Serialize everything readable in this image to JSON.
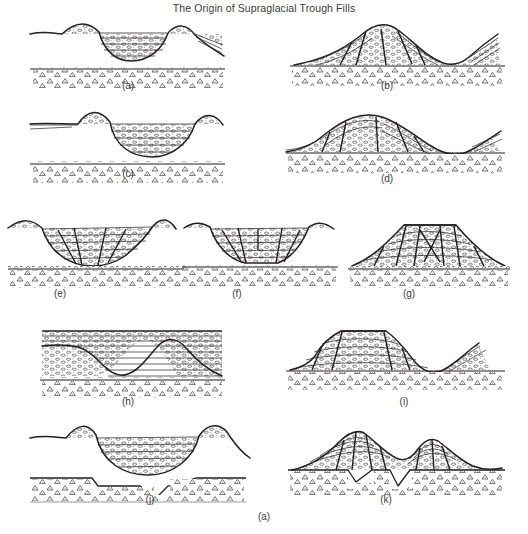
{
  "figure": {
    "title": "The Origin of Supraglacial Trough Fills",
    "caption": "(a)",
    "background_color": "#ffffff",
    "ink_color": "#231f20",
    "width": 528,
    "height": 534
  },
  "legend_semantics": {
    "fill_texture": "stratified-pebbly-sediment",
    "substrate_texture": "diamicton-triangles",
    "line_texture": "fault-and-bedding-lines"
  },
  "panels": [
    {
      "id": "a",
      "label": "(a)",
      "row": 1,
      "col": 1,
      "type": "trough-fill-basin",
      "label_x": 128,
      "label_y": 80
    },
    {
      "id": "b",
      "label": "(b)",
      "row": 1,
      "col": 2,
      "type": "inverted-mound-faulted",
      "label_x": 387,
      "label_y": 80
    },
    {
      "id": "c",
      "label": "(c)",
      "row": 2,
      "col": 1,
      "type": "deep-trough-fill",
      "label_x": 128,
      "label_y": 168
    },
    {
      "id": "d",
      "label": "(d)",
      "row": 2,
      "col": 2,
      "type": "inverted-broad-mound",
      "label_x": 387,
      "label_y": 173
    },
    {
      "id": "e",
      "label": "(e)",
      "row": 3,
      "col": 1,
      "type": "wide-shallow-basin",
      "label_x": 60,
      "label_y": 288
    },
    {
      "id": "f",
      "label": "(f)",
      "row": 3,
      "col": 2,
      "type": "flat-floored-basin",
      "label_x": 237,
      "label_y": 288
    },
    {
      "id": "g",
      "label": "(g)",
      "row": 3,
      "col": 3,
      "type": "inverted-plateau-mound",
      "label_x": 409,
      "label_y": 288
    },
    {
      "id": "h",
      "label": "(h)",
      "row": 4,
      "col": 1,
      "type": "buried-trough-flat-fill",
      "label_x": 128,
      "label_y": 396
    },
    {
      "id": "i",
      "label": "(i)",
      "row": 4,
      "col": 2,
      "type": "inverted-flat-topped-mound",
      "label_x": 404,
      "label_y": 396
    },
    {
      "id": "j",
      "label": "(j)",
      "row": 5,
      "col": 1,
      "type": "trough-over-irregular-substrate",
      "label_x": 150,
      "label_y": 494
    },
    {
      "id": "k",
      "label": "(k)",
      "row": 5,
      "col": 2,
      "type": "inverted-irregular-mound",
      "label_x": 386,
      "label_y": 494
    }
  ]
}
